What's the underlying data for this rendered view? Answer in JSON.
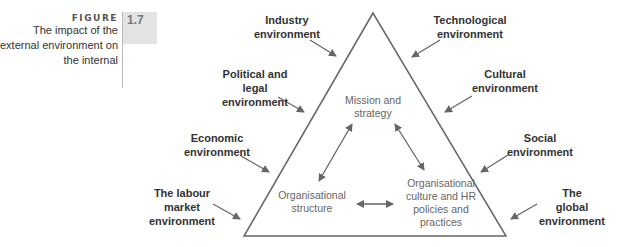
{
  "figure": {
    "word": "FIGURE",
    "number": "1.7",
    "caption_lines": [
      "The impact of the",
      "external environment on",
      "the internal"
    ]
  },
  "external": {
    "industry": [
      "Industry",
      "environment"
    ],
    "technological": [
      "Technological",
      "environment"
    ],
    "political": [
      "Political and",
      "legal",
      "environment"
    ],
    "cultural": [
      "Cultural",
      "environment"
    ],
    "economic": [
      "Economic",
      "environment"
    ],
    "social": [
      "Social",
      "environment"
    ],
    "labour": [
      "The labour",
      "market",
      "environment"
    ],
    "global": [
      "The",
      "global",
      "environment"
    ]
  },
  "internal": {
    "mission": [
      "Mission and",
      "strategy"
    ],
    "structure": [
      "Organisational",
      "structure"
    ],
    "culture": [
      "Organisational",
      "culture and HR",
      "policies and",
      "practices"
    ]
  },
  "colors": {
    "line": "#666666",
    "external_text": "#333333",
    "internal_text": "#666666",
    "figure_box": "#e3e3e3"
  }
}
